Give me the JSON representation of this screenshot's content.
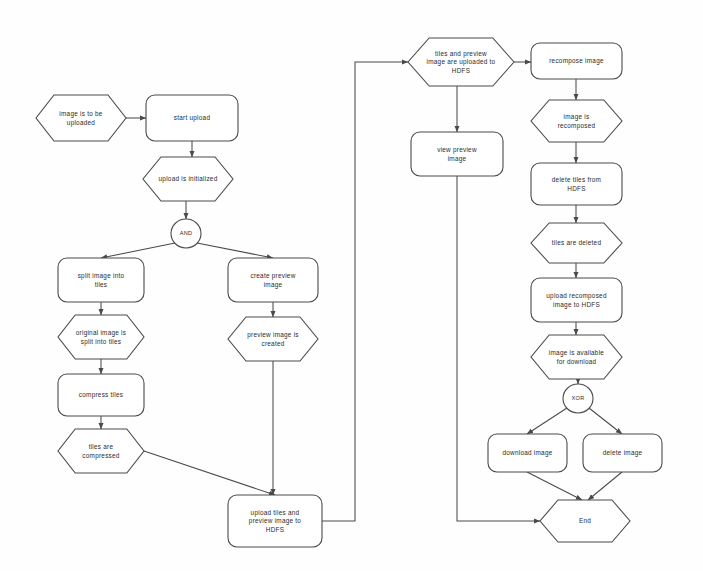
{
  "diagram": {
    "background_color": "#fefefe",
    "stroke_color": "#4a4a4a",
    "text_color": "#2b2b2b",
    "nodes": [
      {
        "id": "image-is-to-be-uploaded",
        "type": "event",
        "label": [
          "image is to be",
          "uploaded"
        ],
        "x": 36,
        "y": 95,
        "w": 90,
        "h": 46
      },
      {
        "id": "start-upload",
        "type": "function",
        "label": [
          "start upload"
        ],
        "x": 146,
        "y": 95,
        "w": 92,
        "h": 46
      },
      {
        "id": "upload-is-initialized",
        "type": "event",
        "label": [
          "upload is initialized"
        ],
        "x": 143,
        "y": 157,
        "w": 90,
        "h": 44
      },
      {
        "id": "and-gateway",
        "type": "gateway",
        "label": [
          "AND"
        ],
        "x": 171,
        "y": 219,
        "w": 30,
        "h": 29
      },
      {
        "id": "split-image-into-tiles",
        "type": "function",
        "label": [
          "split image into",
          "tiles"
        ],
        "x": 58,
        "y": 258,
        "w": 86,
        "h": 44
      },
      {
        "id": "original-image-is-split",
        "type": "event",
        "label": [
          "original image is",
          "split into tiles"
        ],
        "x": 58,
        "y": 315,
        "w": 86,
        "h": 44
      },
      {
        "id": "compress-tiles",
        "type": "function",
        "label": [
          "compress tiles"
        ],
        "x": 58,
        "y": 374,
        "w": 86,
        "h": 42
      },
      {
        "id": "tiles-are-compressed",
        "type": "event",
        "label": [
          "tiles are",
          "compressed"
        ],
        "x": 58,
        "y": 429,
        "w": 86,
        "h": 44
      },
      {
        "id": "create-preview-image",
        "type": "function",
        "label": [
          "create preview",
          "image"
        ],
        "x": 228,
        "y": 258,
        "w": 90,
        "h": 44
      },
      {
        "id": "preview-image-created",
        "type": "event",
        "label": [
          "preview image is",
          "created"
        ],
        "x": 228,
        "y": 317,
        "w": 90,
        "h": 44
      },
      {
        "id": "upload-tiles-preview",
        "type": "function",
        "label": [
          "upload tiles and",
          "preview image to",
          "HDFS"
        ],
        "x": 228,
        "y": 495,
        "w": 94,
        "h": 52
      },
      {
        "id": "tiles-preview-uploaded",
        "type": "event",
        "label": [
          "tiles and preview",
          "image are uploaded to",
          "HDFS"
        ],
        "x": 408,
        "y": 38,
        "w": 106,
        "h": 48
      },
      {
        "id": "view-preview-image",
        "type": "function",
        "label": [
          "view preview",
          "image"
        ],
        "x": 411,
        "y": 132,
        "w": 92,
        "h": 44
      },
      {
        "id": "recompose-image",
        "type": "function",
        "label": [
          "recompose image"
        ],
        "x": 531,
        "y": 43,
        "w": 91,
        "h": 36
      },
      {
        "id": "image-is-recomposed",
        "type": "event",
        "label": [
          "image is",
          "recomposed"
        ],
        "x": 531,
        "y": 100,
        "w": 91,
        "h": 42
      },
      {
        "id": "delete-tiles-from-hdfs",
        "type": "function",
        "label": [
          "delete tiles from",
          "HDFS"
        ],
        "x": 531,
        "y": 163,
        "w": 91,
        "h": 42
      },
      {
        "id": "tiles-are-deleted",
        "type": "event",
        "label": [
          "tiles are deleted"
        ],
        "x": 531,
        "y": 223,
        "w": 91,
        "h": 40
      },
      {
        "id": "upload-recomposed-image",
        "type": "function",
        "label": [
          "upload recomposed",
          "image to HDFS"
        ],
        "x": 531,
        "y": 278,
        "w": 91,
        "h": 44
      },
      {
        "id": "image-available-download",
        "type": "event",
        "label": [
          "image is available",
          "for download"
        ],
        "x": 531,
        "y": 335,
        "w": 91,
        "h": 44
      },
      {
        "id": "xor-gateway",
        "type": "gateway",
        "label": [
          "XOR"
        ],
        "x": 563,
        "y": 384,
        "w": 30,
        "h": 29
      },
      {
        "id": "download-image",
        "type": "function",
        "label": [
          "download image"
        ],
        "x": 488,
        "y": 434,
        "w": 79,
        "h": 38
      },
      {
        "id": "delete-image",
        "type": "function",
        "label": [
          "delete image"
        ],
        "x": 583,
        "y": 434,
        "w": 79,
        "h": 38
      },
      {
        "id": "end",
        "type": "event",
        "label": [
          "End"
        ],
        "x": 540,
        "y": 500,
        "w": 90,
        "h": 42
      }
    ],
    "edges": [
      {
        "id": "e-start",
        "from": "image-is-to-be-uploaded",
        "to": "start-upload",
        "points": "126,118 146,118",
        "arrow": true
      },
      {
        "id": "e-init",
        "from": "start-upload",
        "to": "upload-is-initialized",
        "points": "192,141 192,157",
        "arrow": true
      },
      {
        "id": "e-and",
        "from": "upload-is-initialized",
        "to": "and-gateway",
        "points": "186,201 186,219",
        "arrow": true
      },
      {
        "id": "e-and-split",
        "from": "and-gateway",
        "to": "split-image-into-tiles",
        "points": "175,243 101,258",
        "arrow": true
      },
      {
        "id": "e-and-preview",
        "from": "and-gateway",
        "to": "create-preview-image",
        "points": "197,243 273,258",
        "arrow": true
      },
      {
        "id": "e-split-original",
        "from": "split-image-into-tiles",
        "to": "original-image-is-split",
        "points": "101,302 101,315",
        "arrow": true
      },
      {
        "id": "e-original-compress",
        "from": "original-image-is-split",
        "to": "compress-tiles",
        "points": "101,359 101,374",
        "arrow": true
      },
      {
        "id": "e-compress-tiles",
        "from": "compress-tiles",
        "to": "tiles-are-compressed",
        "points": "101,416 101,429",
        "arrow": true
      },
      {
        "id": "e-compressed-upload",
        "from": "tiles-are-compressed",
        "to": "upload-tiles-preview",
        "points": "144,451 275,495",
        "arrow": true
      },
      {
        "id": "e-preview-created",
        "from": "create-preview-image",
        "to": "preview-image-created",
        "points": "273,302 273,317",
        "arrow": true
      },
      {
        "id": "e-created-upload",
        "from": "preview-image-created",
        "to": "upload-tiles-preview",
        "points": "273,361 273,495",
        "arrow": true
      },
      {
        "id": "e-upload-uploaded",
        "from": "upload-tiles-preview",
        "to": "tiles-preview-uploaded",
        "points": "322,521 355,521 355,62 408,62",
        "arrow": true
      },
      {
        "id": "e-uploaded-recomp",
        "from": "tiles-preview-uploaded",
        "to": "recompose-image",
        "points": "514,62 531,62",
        "arrow": true
      },
      {
        "id": "e-uploaded-view",
        "from": "tiles-preview-uploaded",
        "to": "view-preview-image",
        "points": "457,86 457,132",
        "arrow": true
      },
      {
        "id": "e-view-end",
        "from": "view-preview-image",
        "to": "end",
        "points": "457,176 457,521 540,521",
        "arrow": true
      },
      {
        "id": "e-recomp-recomped",
        "from": "recompose-image",
        "to": "image-is-recomposed",
        "points": "576,79 576,100",
        "arrow": true
      },
      {
        "id": "e-recomped-delete",
        "from": "image-is-recomposed",
        "to": "delete-tiles-from-hdfs",
        "points": "576,142 576,163",
        "arrow": true
      },
      {
        "id": "e-delete-deleted",
        "from": "delete-tiles-from-hdfs",
        "to": "tiles-are-deleted",
        "points": "576,205 576,223",
        "arrow": true
      },
      {
        "id": "e-deleted-upload",
        "from": "tiles-are-deleted",
        "to": "upload-recomposed-image",
        "points": "576,263 576,278",
        "arrow": true
      },
      {
        "id": "e-upload-available",
        "from": "upload-recomposed-image",
        "to": "image-available-download",
        "points": "576,322 576,335",
        "arrow": true
      },
      {
        "id": "e-available-xor",
        "from": "image-available-download",
        "to": "xor-gateway",
        "points": "578,379 578,384",
        "arrow": true
      },
      {
        "id": "e-xor-download",
        "from": "xor-gateway",
        "to": "download-image",
        "points": "567,408 527,434",
        "arrow": true
      },
      {
        "id": "e-xor-delete",
        "from": "xor-gateway",
        "to": "delete-image",
        "points": "589,408 622,434",
        "arrow": true
      },
      {
        "id": "e-download-end",
        "from": "download-image",
        "to": "end",
        "points": "527,472 582,500",
        "arrow": true
      },
      {
        "id": "e-delete-end",
        "from": "delete-image",
        "to": "end",
        "points": "622,472 588,500",
        "arrow": true
      }
    ]
  }
}
